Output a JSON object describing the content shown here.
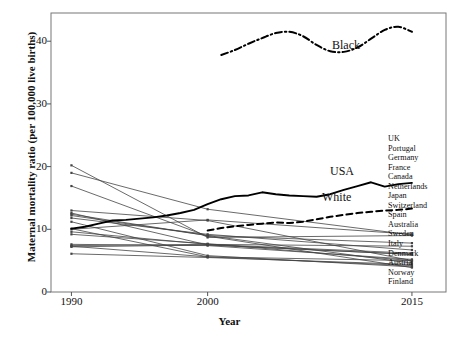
{
  "chart_data": {
    "type": "line",
    "title": "",
    "xlabel": "Year",
    "ylabel": "Maternal mortality ratio (per 100,000 live births)",
    "xticks": [
      1990,
      2000,
      2015
    ],
    "xticklabels": [
      "1990",
      "2000",
      "2015"
    ],
    "yticks": [
      0,
      10,
      20,
      30,
      40
    ],
    "yticklabels": [
      "0",
      "10",
      "20",
      "30",
      "40"
    ],
    "xlim": [
      1988.5,
      2017.5
    ],
    "ylim": [
      0,
      44.5
    ],
    "grid": false,
    "legend_position": "right-inside",
    "annotations": [
      {
        "text": "Black",
        "x": 2012.0,
        "y": 41.2
      },
      {
        "text": "USA",
        "x": 2011.8,
        "y": 19.5
      },
      {
        "text": "White",
        "x": 2010.8,
        "y": 15.0
      }
    ],
    "series": [
      {
        "name": "Black",
        "style": "dashdot",
        "width": 2.0,
        "color": "#000000",
        "markers": false,
        "x": [
          2001,
          2002,
          2003,
          2004,
          2005,
          2006,
          2007,
          2008,
          2009,
          2010,
          2011,
          2012,
          2013,
          2014,
          2015
        ],
        "values": [
          37.8,
          38.6,
          39.6,
          40.5,
          41.3,
          41.5,
          40.8,
          39.4,
          38.4,
          38.3,
          39.0,
          40.4,
          41.8,
          42.3,
          41.5
        ]
      },
      {
        "name": "USA",
        "style": "solid",
        "width": 1.9,
        "color": "#000000",
        "markers": false,
        "x": [
          1990,
          1991,
          1992,
          1993,
          1994,
          1995,
          1996,
          1997,
          1998,
          1999,
          2000,
          2001,
          2002,
          2003,
          2004,
          2005,
          2006,
          2007,
          2008,
          2009,
          2010,
          2011,
          2012,
          2013,
          2014,
          2015
        ],
        "values": [
          10.1,
          10.4,
          10.9,
          11.4,
          11.5,
          11.7,
          11.9,
          12.2,
          12.6,
          13.1,
          14.0,
          14.8,
          15.3,
          15.4,
          15.9,
          15.6,
          15.4,
          15.3,
          15.2,
          15.6,
          16.3,
          16.9,
          17.5,
          16.8,
          17.2,
          17.4
        ]
      },
      {
        "name": "White",
        "style": "dashed",
        "width": 2.0,
        "color": "#000000",
        "markers": false,
        "x": [
          2000,
          2001,
          2002,
          2003,
          2004,
          2005,
          2006,
          2007,
          2008,
          2009,
          2010,
          2011,
          2012,
          2013,
          2014,
          2015
        ],
        "values": [
          9.8,
          10.2,
          10.5,
          10.7,
          10.9,
          11.1,
          11.0,
          11.2,
          11.6,
          12.0,
          12.3,
          12.6,
          12.8,
          13.0,
          13.1,
          13.3
        ]
      },
      {
        "name": "UK",
        "style": "thin",
        "color": "#444444",
        "markers": true,
        "x": [
          1990,
          2000,
          2015
        ],
        "values": [
          10.0,
          11.5,
          9.2
        ]
      },
      {
        "name": "Portugal",
        "style": "thin",
        "color": "#444444",
        "markers": true,
        "x": [
          1990,
          2000,
          2015
        ],
        "values": [
          20.2,
          8.7,
          9.0
        ]
      },
      {
        "name": "Germany",
        "style": "thin",
        "color": "#444444",
        "markers": true,
        "x": [
          1990,
          2000,
          2015
        ],
        "values": [
          12.6,
          7.5,
          6.0
        ]
      },
      {
        "name": "France",
        "style": "thin",
        "color": "#444444",
        "markers": true,
        "x": [
          1990,
          2000,
          2015
        ],
        "values": [
          12.2,
          9.0,
          7.8
        ]
      },
      {
        "name": "Canada",
        "style": "thin",
        "color": "#444444",
        "markers": true,
        "x": [
          1990,
          2000,
          2015
        ],
        "values": [
          7.4,
          7.6,
          7.3
        ]
      },
      {
        "name": "Netherlands",
        "style": "thin",
        "color": "#444444",
        "markers": true,
        "x": [
          1990,
          2000,
          2015
        ],
        "values": [
          11.8,
          9.2,
          6.7
        ]
      },
      {
        "name": "Japan",
        "style": "thin",
        "color": "#444444",
        "markers": true,
        "x": [
          1990,
          2000,
          2015
        ],
        "values": [
          13.0,
          11.4,
          5.0
        ]
      },
      {
        "name": "Switzerland",
        "style": "thin",
        "color": "#444444",
        "markers": true,
        "x": [
          1990,
          2000,
          2015
        ],
        "values": [
          7.6,
          7.4,
          5.2
        ]
      },
      {
        "name": "Spain",
        "style": "thin",
        "color": "#444444",
        "markers": true,
        "x": [
          1990,
          2000,
          2015
        ],
        "values": [
          7.3,
          5.6,
          5.0
        ]
      },
      {
        "name": "Australia",
        "style": "thin",
        "color": "#444444",
        "markers": true,
        "x": [
          1990,
          2000,
          2015
        ],
        "values": [
          7.2,
          7.5,
          6.0
        ]
      },
      {
        "name": "Sweden",
        "style": "thin",
        "color": "#444444",
        "markers": true,
        "x": [
          1990,
          2000,
          2015
        ],
        "values": [
          6.1,
          5.5,
          4.4
        ]
      },
      {
        "name": "Italy",
        "style": "thin",
        "color": "#444444",
        "markers": true,
        "x": [
          1990,
          2000,
          2015
        ],
        "values": [
          10.1,
          5.6,
          4.2
        ]
      },
      {
        "name": "Denmark",
        "style": "thin",
        "color": "#444444",
        "markers": true,
        "x": [
          1990,
          2000,
          2015
        ],
        "values": [
          9.6,
          7.6,
          6.2
        ]
      },
      {
        "name": "Austria",
        "style": "thin",
        "color": "#444444",
        "markers": true,
        "x": [
          1990,
          2000,
          2015
        ],
        "values": [
          11.2,
          5.8,
          4.0
        ]
      },
      {
        "name": "Norway",
        "style": "thin",
        "color": "#444444",
        "markers": true,
        "x": [
          1990,
          2000,
          2015
        ],
        "values": [
          9.2,
          7.7,
          5.0
        ]
      },
      {
        "name": "Finland",
        "style": "thin",
        "color": "#444444",
        "markers": true,
        "x": [
          1990,
          2000,
          2015
        ],
        "values": [
          16.9,
          8.9,
          3.9
        ]
      },
      {
        "name": "extra-1",
        "style": "thin",
        "color": "#444444",
        "markers": true,
        "x": [
          1990,
          2000,
          2015
        ],
        "values": [
          19.0,
          13.2,
          9.1
        ]
      },
      {
        "name": "extra-2",
        "style": "thin",
        "color": "#444444",
        "markers": true,
        "x": [
          1990,
          2000,
          2015
        ],
        "values": [
          12.4,
          9.0,
          4.6
        ]
      }
    ],
    "country_legend": [
      "UK",
      "Portugal",
      "Germany",
      "France",
      "Canada",
      "Netherlands",
      "Japan",
      "Switzerland",
      "Spain",
      "Australia",
      "Sweden",
      "Italy",
      "Denmark",
      "Austria",
      "Norway",
      "Finland"
    ]
  },
  "axes": {
    "xlabel": "Year",
    "ylabel": "Maternal mortality ratio (per 100,000 live births)",
    "frame_color": "#777777"
  },
  "annotations": {
    "black": "Black",
    "usa": "USA",
    "white": "White"
  }
}
